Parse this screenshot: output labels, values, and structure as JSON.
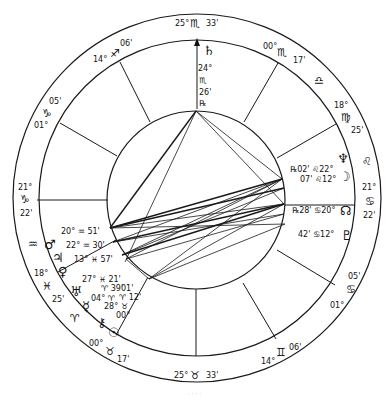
{
  "chart": {
    "center": [
      197,
      198
    ],
    "outer_radius": 184,
    "house_radius": 158,
    "inner_radius": 89,
    "line_color": "#1a1a1a"
  },
  "cusps": [
    {
      "name": "mc",
      "deg": "25°",
      "sign": "♏",
      "min": "33'",
      "x1": 197,
      "y1": 109,
      "x2": 197,
      "y2": 40,
      "arrow": true
    },
    {
      "name": "cusp-11",
      "deg": "00°",
      "sign": "♏",
      "min": "17'",
      "x1": 244,
      "y1": 122,
      "x2": 278,
      "y2": 63
    },
    {
      "name": "cusp-12",
      "deg": "18°",
      "sign": "♍",
      "min": "25'",
      "x1": 277,
      "y1": 158,
      "x2": 336,
      "y2": 124
    },
    {
      "name": "asc",
      "deg": "21°",
      "sign": "♋",
      "min": "22'",
      "x1": 285,
      "y1": 205,
      "x2": 355,
      "y2": 205
    },
    {
      "name": "cusp-2",
      "deg": "01°",
      "sign": "♋",
      "min": "05'",
      "x1": 277,
      "y1": 250,
      "x2": 335,
      "y2": 285
    },
    {
      "name": "cusp-3",
      "deg": "14°",
      "sign": "♊",
      "min": "06'",
      "x1": 243,
      "y1": 283,
      "x2": 276,
      "y2": 339
    },
    {
      "name": "ic",
      "deg": "25°",
      "sign": "♉",
      "min": "33'",
      "x1": 196,
      "y1": 289,
      "x2": 196,
      "y2": 356
    },
    {
      "name": "cusp-5",
      "deg": "00°",
      "sign": "♉",
      "min": "17'",
      "x1": 148,
      "y1": 277,
      "x2": 116,
      "y2": 335
    },
    {
      "name": "cusp-6",
      "deg": "18°",
      "sign": "♓",
      "min": "25'",
      "x1": 116,
      "y1": 240,
      "x2": 58,
      "y2": 272
    },
    {
      "name": "dsc",
      "deg": "21°",
      "sign": "♑",
      "min": "22'",
      "x1": 108,
      "y1": 200,
      "x2": 37,
      "y2": 200
    },
    {
      "name": "cusp-8",
      "deg": "01°",
      "sign": "♑",
      "min": "05'",
      "x1": 117,
      "y1": 156,
      "x2": 60,
      "y2": 123
    },
    {
      "name": "cusp-9",
      "deg": "14°",
      "sign": "♐",
      "min": "06'",
      "x1": 150,
      "y1": 122,
      "x2": 120,
      "y2": 62
    }
  ],
  "outer_labels": [
    {
      "text": "25°",
      "x": 175,
      "y": 26,
      "cls": "lbl"
    },
    {
      "text": "♏",
      "x": 190,
      "y": 27,
      "cls": "sgl"
    },
    {
      "text": "33'",
      "x": 206,
      "y": 26,
      "cls": "lbl"
    },
    {
      "text": "14°",
      "x": 93,
      "y": 62,
      "cls": "lbl"
    },
    {
      "text": "♐",
      "x": 110,
      "y": 57,
      "cls": "sgl"
    },
    {
      "text": "06'",
      "x": 120,
      "y": 46,
      "cls": "lbl"
    },
    {
      "text": "00°",
      "x": 263,
      "y": 49,
      "cls": "lbl"
    },
    {
      "text": "♏",
      "x": 277,
      "y": 56,
      "cls": "sgl"
    },
    {
      "text": "17'",
      "x": 293,
      "y": 63,
      "cls": "lbl"
    },
    {
      "text": "♎",
      "x": 314,
      "y": 84,
      "cls": "sgl"
    },
    {
      "text": "18°",
      "x": 334,
      "y": 108,
      "cls": "lbl"
    },
    {
      "text": "♍",
      "x": 341,
      "y": 121,
      "cls": "sgl"
    },
    {
      "text": "25'",
      "x": 351,
      "y": 133,
      "cls": "lbl"
    },
    {
      "text": "♌",
      "x": 362,
      "y": 165,
      "cls": "sgl"
    },
    {
      "text": "21°",
      "x": 362,
      "y": 190,
      "cls": "lbl"
    },
    {
      "text": "♋",
      "x": 365,
      "y": 205,
      "cls": "sgl"
    },
    {
      "text": "22'",
      "x": 363,
      "y": 218,
      "cls": "lbl"
    },
    {
      "text": "05'",
      "x": 348,
      "y": 279,
      "cls": "lbl"
    },
    {
      "text": "♋",
      "x": 346,
      "y": 293,
      "cls": "sgl"
    },
    {
      "text": "01°",
      "x": 330,
      "y": 308,
      "cls": "lbl"
    },
    {
      "text": "06'",
      "x": 289,
      "y": 350,
      "cls": "lbl"
    },
    {
      "text": "♊",
      "x": 276,
      "y": 356,
      "cls": "sgl"
    },
    {
      "text": "14°",
      "x": 261,
      "y": 364,
      "cls": "lbl"
    },
    {
      "text": "25°",
      "x": 174,
      "y": 378,
      "cls": "lbl"
    },
    {
      "text": "♉",
      "x": 190,
      "y": 379,
      "cls": "sgl"
    },
    {
      "text": "33'",
      "x": 206,
      "y": 378,
      "cls": "lbl"
    },
    {
      "text": "00°",
      "x": 89,
      "y": 346,
      "cls": "lbl"
    },
    {
      "text": "♉",
      "x": 105,
      "y": 355,
      "cls": "sgl"
    },
    {
      "text": "17'",
      "x": 117,
      "y": 362,
      "cls": "lbl"
    },
    {
      "text": "♈",
      "x": 70,
      "y": 322,
      "cls": "sgl"
    },
    {
      "text": "18°",
      "x": 34,
      "y": 276,
      "cls": "lbl"
    },
    {
      "text": "♓",
      "x": 42,
      "y": 290,
      "cls": "sgl"
    },
    {
      "text": "25'",
      "x": 52,
      "y": 302,
      "cls": "lbl"
    },
    {
      "text": "♒",
      "x": 28,
      "y": 248,
      "cls": "sgl"
    },
    {
      "text": "21°",
      "x": 18,
      "y": 190,
      "cls": "lbl"
    },
    {
      "text": "♑",
      "x": 20,
      "y": 203,
      "cls": "sgl"
    },
    {
      "text": "22'",
      "x": 20,
      "y": 216,
      "cls": "lbl"
    },
    {
      "text": "05'",
      "x": 49,
      "y": 104,
      "cls": "lbl"
    },
    {
      "text": "♑",
      "x": 42,
      "y": 117,
      "cls": "sgl"
    },
    {
      "text": "01°",
      "x": 34,
      "y": 128,
      "cls": "lbl"
    }
  ],
  "planets": [
    {
      "name": "saturn",
      "glyph": "♄",
      "x": 203,
      "y": 55,
      "cls": "glyph"
    },
    {
      "name": "saturn-deg",
      "glyph": "24°",
      "x": 198,
      "y": 71,
      "cls": "lbl"
    },
    {
      "name": "saturn-sign",
      "glyph": "♏",
      "x": 199,
      "y": 83,
      "cls": "lbl"
    },
    {
      "name": "saturn-min",
      "glyph": "26'",
      "x": 199,
      "y": 95,
      "cls": "lbl"
    },
    {
      "name": "saturn-retro",
      "glyph": "℞",
      "x": 199,
      "y": 106,
      "cls": "lbl"
    },
    {
      "name": "neptune",
      "glyph": "♆",
      "x": 337,
      "y": 163,
      "cls": "glyph"
    },
    {
      "name": "neptune-pos",
      "glyph": "℞02' ♌22°",
      "x": 290,
      "y": 172,
      "cls": "lbl"
    },
    {
      "name": "moon",
      "glyph": "☽",
      "x": 339,
      "y": 181,
      "cls": "glyph"
    },
    {
      "name": "moon-pos",
      "glyph": "07' ♌12°",
      "x": 300,
      "y": 182,
      "cls": "lbl"
    },
    {
      "name": "north-node",
      "glyph": "☊",
      "x": 340,
      "y": 215,
      "cls": "glyph"
    },
    {
      "name": "node-pos",
      "glyph": "℞28' ♋20°",
      "x": 292,
      "y": 213,
      "cls": "lbl"
    },
    {
      "name": "pluto",
      "glyph": "♇",
      "x": 341,
      "y": 240,
      "cls": "glyph"
    },
    {
      "name": "pluto-pos",
      "glyph": "42' ♋12°",
      "x": 298,
      "y": 237,
      "cls": "lbl"
    },
    {
      "name": "mars",
      "glyph": "♂",
      "x": 44,
      "y": 249,
      "cls": "glyph"
    },
    {
      "name": "mars-pos",
      "glyph": "20° ♒ 51'",
      "x": 61,
      "y": 234,
      "cls": "lbl"
    },
    {
      "name": "jupiter",
      "glyph": "♃",
      "x": 52,
      "y": 262,
      "cls": "glyph"
    },
    {
      "name": "jupiter-pos",
      "glyph": "22° ♒ 30'",
      "x": 66,
      "y": 248,
      "cls": "lbl"
    },
    {
      "name": "venus",
      "glyph": "♀",
      "x": 58,
      "y": 276,
      "cls": "glyph"
    },
    {
      "name": "venus-pos",
      "glyph": "13° ♓ 57'",
      "x": 74,
      "y": 262,
      "cls": "lbl"
    },
    {
      "name": "uranus",
      "glyph": "♅",
      "x": 70,
      "y": 296,
      "cls": "glyph"
    },
    {
      "name": "uranus-pos-1",
      "glyph": "27° ♓ 21'",
      "x": 82,
      "y": 282,
      "cls": "lbl"
    },
    {
      "name": "uranus-pos-2",
      "glyph": "♈ 39'",
      "x": 101,
      "y": 291,
      "cls": "lbl"
    },
    {
      "name": "mercury",
      "glyph": "☿",
      "x": 82,
      "y": 311,
      "cls": "glyph"
    },
    {
      "name": "mercury-pos",
      "glyph": "04° ♈",
      "x": 91,
      "y": 301,
      "cls": "lbl"
    },
    {
      "name": "sun-pos-1",
      "glyph": "01'",
      "x": 121,
      "y": 291,
      "cls": "lbl"
    },
    {
      "name": "sun-pos-2",
      "glyph": "♈ 12'",
      "x": 119,
      "y": 300,
      "cls": "lbl"
    },
    {
      "name": "sun-pos-3",
      "glyph": "28° ♉",
      "x": 104,
      "y": 309,
      "cls": "lbl"
    },
    {
      "name": "sun-pos-4",
      "glyph": "00°",
      "x": 116,
      "y": 318,
      "cls": "lbl"
    },
    {
      "name": "chiron",
      "glyph": "⚷",
      "x": 97,
      "y": 327,
      "cls": "glyph"
    },
    {
      "name": "sun",
      "glyph": "☉",
      "x": 108,
      "y": 337,
      "cls": "glyph"
    }
  ],
  "aspect_lines": [
    {
      "x1": 196,
      "y1": 111,
      "x2": 110,
      "y2": 228,
      "bold": true
    },
    {
      "x1": 196,
      "y1": 111,
      "x2": 125,
      "y2": 262,
      "bold": false
    },
    {
      "x1": 196,
      "y1": 111,
      "x2": 282,
      "y2": 179,
      "bold": false
    },
    {
      "x1": 196,
      "y1": 111,
      "x2": 284,
      "y2": 204,
      "bold": false
    },
    {
      "x1": 110,
      "y1": 228,
      "x2": 282,
      "y2": 179,
      "bold": true
    },
    {
      "x1": 110,
      "y1": 228,
      "x2": 284,
      "y2": 188,
      "bold": true
    },
    {
      "x1": 110,
      "y1": 228,
      "x2": 284,
      "y2": 204,
      "bold": false
    },
    {
      "x1": 110,
      "y1": 228,
      "x2": 285,
      "y2": 224,
      "bold": false
    },
    {
      "x1": 113,
      "y1": 242,
      "x2": 282,
      "y2": 179,
      "bold": false
    },
    {
      "x1": 113,
      "y1": 242,
      "x2": 284,
      "y2": 204,
      "bold": true
    },
    {
      "x1": 113,
      "y1": 242,
      "x2": 284,
      "y2": 214,
      "bold": false
    },
    {
      "x1": 122,
      "y1": 255,
      "x2": 282,
      "y2": 179,
      "bold": false
    },
    {
      "x1": 122,
      "y1": 255,
      "x2": 284,
      "y2": 188,
      "bold": false
    },
    {
      "x1": 122,
      "y1": 255,
      "x2": 284,
      "y2": 204,
      "bold": true
    },
    {
      "x1": 126,
      "y1": 259,
      "x2": 282,
      "y2": 179,
      "bold": false
    },
    {
      "x1": 126,
      "y1": 259,
      "x2": 284,
      "y2": 214,
      "bold": false
    },
    {
      "x1": 149,
      "y1": 279,
      "x2": 282,
      "y2": 179,
      "bold": false
    },
    {
      "x1": 149,
      "y1": 279,
      "x2": 284,
      "y2": 204,
      "bold": false
    },
    {
      "x1": 149,
      "y1": 279,
      "x2": 285,
      "y2": 224,
      "bold": false
    },
    {
      "x1": 126,
      "y1": 259,
      "x2": 149,
      "y2": 279,
      "bold": false
    }
  ],
  "caption": "· · · ·"
}
